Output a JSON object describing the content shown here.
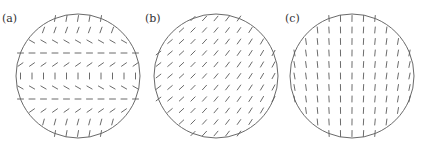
{
  "figure": {
    "width": 429,
    "height": 148,
    "colors": {
      "outline": "#6a6a6a",
      "tick": "#5a5a5a",
      "label": "#333333",
      "background": "#ffffff"
    },
    "tick_length": 6,
    "grid_spacing": 11.5,
    "panels": [
      {
        "label": "(a)",
        "label_pos": [
          2,
          22
        ],
        "center": [
          78,
          76
        ],
        "radius": 62,
        "pattern": "alternating-rows",
        "row_angles_deg": [
          80,
          70,
          -30,
          0,
          35,
          90,
          -30,
          0,
          35,
          75,
          80
        ],
        "description": "Rows of director ticks alternate orientation: near-vertical, backslash, horizontal, slash, vertical, repeating"
      },
      {
        "label": "(b)",
        "label_pos": [
          145,
          22
        ],
        "center": [
          216,
          76
        ],
        "radius": 62,
        "pattern": "uniform-slant",
        "angle_left_deg": 38,
        "angle_right_deg": 62,
        "description": "All ticks slanted forward-slash, steepening toward the right"
      },
      {
        "label": "(c)",
        "label_pos": [
          285,
          22
        ],
        "center": [
          352,
          76
        ],
        "radius": 62,
        "pattern": "near-vertical",
        "angle_left_deg": 100,
        "angle_right_deg": 78,
        "description": "Near-vertical ticks, slightly backslash on left, slightly slash on right"
      }
    ]
  }
}
